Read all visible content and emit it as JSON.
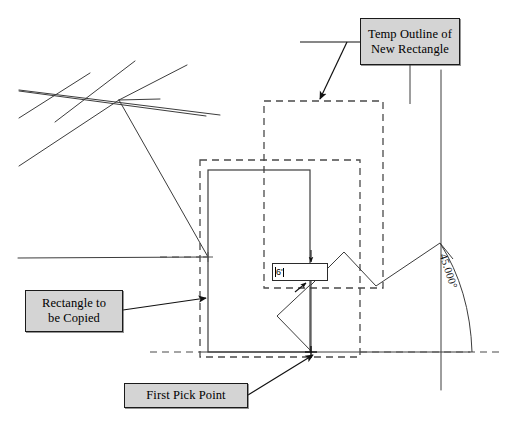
{
  "diagram": {
    "line_color": "#3c3c3c",
    "dashed_color": "#4a4a4a",
    "callout_fill": "#d4d4d4",
    "callout_border": "#1a1a1a"
  },
  "callouts": {
    "temp_outline": {
      "line1": "Temp Outline of",
      "line2": "New Rectangle"
    },
    "rectangle_copied": {
      "line1": "Rectangle to",
      "line2": "be Copied"
    },
    "first_pick": {
      "line1": "First Pick Point"
    }
  },
  "dimension_input": {
    "value": "6'",
    "placeholder": "6'"
  },
  "angle": {
    "label": "45.000°",
    "value": 45.0,
    "units": "degrees"
  },
  "icons": {
    "arrowhead": "arrow-pointer-icon",
    "pick_marker": "pick-point-marker-icon"
  }
}
